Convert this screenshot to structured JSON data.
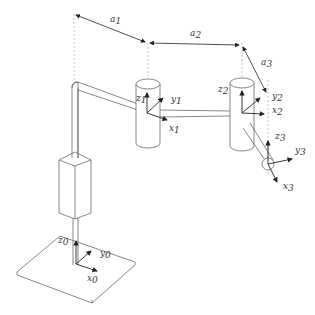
{
  "diagram": {
    "type": "robot-arm-kinematic-frames",
    "link_lengths": {
      "a1": {
        "base": "a",
        "sub": "1"
      },
      "a2": {
        "base": "a",
        "sub": "2"
      },
      "a3": {
        "base": "a",
        "sub": "3"
      }
    },
    "frames": [
      {
        "id": "0",
        "axes": [
          {
            "base": "z",
            "sub": "0"
          },
          {
            "base": "y",
            "sub": "0"
          },
          {
            "base": "x",
            "sub": "0"
          }
        ]
      },
      {
        "id": "1",
        "axes": [
          {
            "base": "z",
            "sub": "1"
          },
          {
            "base": "y",
            "sub": "1"
          },
          {
            "base": "x",
            "sub": "1"
          }
        ]
      },
      {
        "id": "2",
        "axes": [
          {
            "base": "z",
            "sub": "2"
          },
          {
            "base": "y",
            "sub": "2"
          },
          {
            "base": "x",
            "sub": "2"
          }
        ]
      },
      {
        "id": "3",
        "axes": [
          {
            "base": "z",
            "sub": "3"
          },
          {
            "base": "y",
            "sub": "3"
          },
          {
            "base": "x",
            "sub": "3"
          }
        ]
      }
    ],
    "colors": {
      "line": "#555555",
      "axis": "#222222",
      "dashed": "#888888"
    }
  }
}
